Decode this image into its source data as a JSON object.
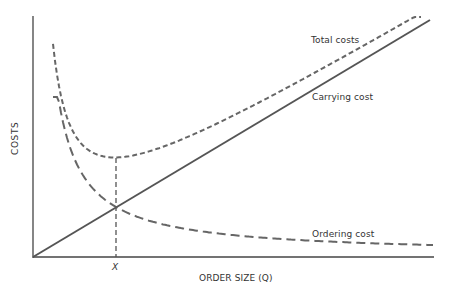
{
  "chart_data": {
    "type": "line",
    "title": "",
    "xlabel": "ORDER SIZE (Q)",
    "ylabel": "COSTS",
    "x_tick_labels": [
      {
        "x": 0.206,
        "label": "X"
      }
    ],
    "grid": false,
    "legend": "none (inline curve labels)",
    "xlim": [
      0,
      1
    ],
    "ylim": [
      0,
      1
    ],
    "series": [
      {
        "name": "Total costs",
        "style": "short-dashed",
        "x": [
          0.05,
          0.1,
          0.206,
          0.3,
          0.5,
          0.7,
          0.98
        ],
        "y": [
          0.66,
          0.5,
          0.42,
          0.44,
          0.56,
          0.71,
          1.0
        ]
      },
      {
        "name": "Carrying cost",
        "style": "solid",
        "x": [
          0,
          0.5,
          1.0
        ],
        "y": [
          0,
          0.5,
          0.985
        ]
      },
      {
        "name": "Ordering cost",
        "style": "long-dashed",
        "x": [
          0.05,
          0.1,
          0.206,
          0.4,
          0.7,
          1.0
        ],
        "y": [
          0.6,
          0.42,
          0.21,
          0.11,
          0.06,
          0.02
        ]
      }
    ],
    "annotations": [
      {
        "text": "Total costs",
        "near": "top right of total cost curve"
      },
      {
        "text": "Carrying cost",
        "near": "below total cost, above carrying line"
      },
      {
        "text": "Ordering cost",
        "near": "bottom right above ordering curve"
      },
      {
        "text": "X",
        "note": "optimal order size where carrying = ordering, total cost minimum"
      }
    ]
  },
  "labels": {
    "total": "Total costs",
    "carrying": "Carrying cost",
    "ordering": "Ordering cost",
    "xmark": "X",
    "xaxis": "ORDER SIZE (Q)",
    "yaxis": "COSTS"
  },
  "colors": {
    "line": "#555555",
    "axis": "#444444"
  }
}
